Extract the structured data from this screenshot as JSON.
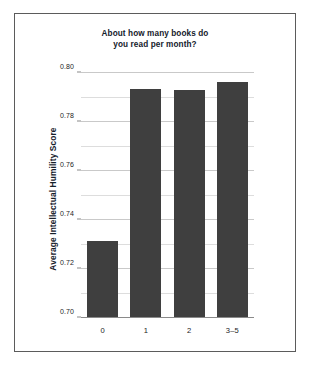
{
  "figure": {
    "title_lines": [
      "About how many books do",
      "you read per month?"
    ],
    "y_axis_title": "Average Intellectual Humility Score",
    "bar_color": "#3f3f3f",
    "grid_color": "#c9c9c9",
    "frame_color": "#5b5b5b"
  },
  "chart_data": {
    "type": "bar",
    "title": "About how many books do you read per month?",
    "xlabel": "",
    "ylabel": "Average Intellectual Humility Score",
    "categories": [
      "0",
      "1",
      "2",
      "3–5"
    ],
    "values": [
      0.7315,
      0.7935,
      0.793,
      0.7965
    ],
    "ylim": [
      0.7,
      0.8
    ],
    "ytick_labels": [
      "0.70",
      "0.72",
      "0.74",
      "0.76",
      "0.78",
      "0.80"
    ],
    "ytick_values": [
      0.7,
      0.72,
      0.74,
      0.76,
      0.78,
      0.8
    ],
    "minor_tick_values": [
      0.71,
      0.73,
      0.75,
      0.77,
      0.79
    ],
    "grid": true,
    "legend": null,
    "series": [
      {
        "name": "Average Intellectual Humility Score",
        "values": [
          0.7315,
          0.7935,
          0.793,
          0.7965
        ]
      }
    ]
  }
}
